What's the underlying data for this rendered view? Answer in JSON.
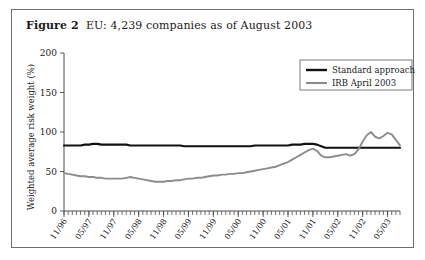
{
  "figure": {
    "label": "Figure 2",
    "caption": "EU: 4,239 companies as of August 2003"
  },
  "chart_data": {
    "type": "line",
    "title": "EU: 4,239 companies as of August 2003",
    "xlabel": "",
    "ylabel": "Weighted average risk weight (%)",
    "ylim": [
      0,
      200
    ],
    "yticks": [
      0,
      50,
      100,
      150,
      200
    ],
    "ytick_labels": [
      "0",
      "50",
      "100",
      "150",
      "200"
    ],
    "grid": false,
    "legend_position": "top-right",
    "xtick_labels": [
      "11/96",
      "05/97",
      "11/97",
      "05/98",
      "11/98",
      "05/99",
      "11/99",
      "05/00",
      "11/00",
      "05/01",
      "11/01",
      "05/02",
      "11/02",
      "05/03"
    ],
    "x": [
      "11/96",
      "12/96",
      "01/97",
      "02/97",
      "03/97",
      "04/97",
      "05/97",
      "06/97",
      "07/97",
      "08/97",
      "09/97",
      "10/97",
      "11/97",
      "12/97",
      "01/98",
      "02/98",
      "03/98",
      "04/98",
      "05/98",
      "06/98",
      "07/98",
      "08/98",
      "09/98",
      "10/98",
      "11/98",
      "12/98",
      "01/99",
      "02/99",
      "03/99",
      "04/99",
      "05/99",
      "06/99",
      "07/99",
      "08/99",
      "09/99",
      "10/99",
      "11/99",
      "12/99",
      "01/00",
      "02/00",
      "03/00",
      "04/00",
      "05/00",
      "06/00",
      "07/00",
      "08/00",
      "09/00",
      "10/00",
      "11/00",
      "12/00",
      "01/01",
      "02/01",
      "03/01",
      "04/01",
      "05/01",
      "06/01",
      "07/01",
      "08/01",
      "09/01",
      "10/01",
      "11/01",
      "12/01",
      "01/02",
      "02/02",
      "03/02",
      "04/02",
      "05/02",
      "06/02",
      "07/02",
      "08/02",
      "09/02",
      "10/02",
      "11/02",
      "12/02",
      "01/03",
      "02/03",
      "03/03",
      "04/03",
      "05/03",
      "06/03",
      "07/03",
      "08/03"
    ],
    "series": [
      {
        "name": "Standard approach",
        "color": "#111111",
        "values": [
          83,
          83,
          83,
          83,
          83,
          84,
          84,
          85,
          85,
          84,
          84,
          84,
          84,
          84,
          84,
          84,
          83,
          83,
          83,
          83,
          83,
          83,
          83,
          83,
          83,
          83,
          83,
          83,
          83,
          82,
          82,
          82,
          82,
          82,
          82,
          82,
          82,
          82,
          82,
          82,
          82,
          82,
          82,
          82,
          82,
          82,
          83,
          83,
          83,
          83,
          83,
          83,
          83,
          83,
          83,
          84,
          84,
          84,
          85,
          85,
          85,
          84,
          82,
          80,
          80,
          80,
          80,
          80,
          80,
          80,
          80,
          80,
          80,
          80,
          80,
          80,
          80,
          80,
          80,
          80,
          80,
          80
        ]
      },
      {
        "name": "IRB April 2003",
        "color": "#8c8c8c",
        "values": [
          48,
          47,
          46,
          45,
          44,
          44,
          43,
          43,
          42,
          42,
          41,
          41,
          41,
          41,
          41,
          42,
          43,
          42,
          41,
          40,
          39,
          38,
          37,
          37,
          37,
          38,
          38,
          39,
          39,
          40,
          41,
          41,
          42,
          42,
          43,
          44,
          45,
          45,
          46,
          46,
          47,
          47,
          48,
          48,
          49,
          50,
          51,
          52,
          53,
          54,
          55,
          56,
          58,
          60,
          62,
          65,
          68,
          71,
          74,
          77,
          79,
          76,
          70,
          68,
          68,
          69,
          70,
          71,
          72,
          70,
          72,
          78,
          88,
          96,
          100,
          94,
          92,
          95,
          99,
          97,
          90,
          83
        ]
      }
    ],
    "legend": [
      {
        "name": "Standard approach",
        "color": "#111111"
      },
      {
        "name": "IRB April 2003",
        "color": "#8c8c8c"
      }
    ]
  }
}
